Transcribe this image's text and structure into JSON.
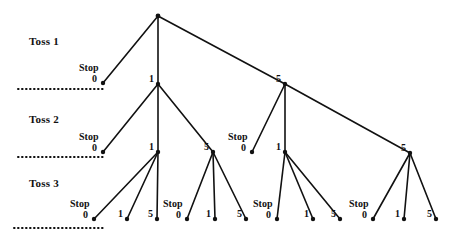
{
  "diagram": {
    "type": "tree",
    "line_color": "#111111",
    "node_color": "#111111",
    "background": "#ffffff",
    "dotted_color": "#111111"
  },
  "level_labels": [
    {
      "id": "toss1",
      "text": "Toss 1",
      "x": 29,
      "y": 35
    },
    {
      "id": "toss2",
      "text": "Toss 2",
      "x": 29,
      "y": 113
    },
    {
      "id": "toss3",
      "text": "Toss 3",
      "x": 29,
      "y": 177
    }
  ],
  "dotted_lines": [
    {
      "id": "divider-toss1",
      "x1": 18,
      "x2": 106,
      "y": 89
    },
    {
      "id": "divider-toss2",
      "x1": 18,
      "x2": 106,
      "y": 157
    },
    {
      "id": "divider-toss3",
      "x1": 14,
      "x2": 106,
      "y": 228
    }
  ],
  "nodes": [
    {
      "id": "root",
      "label": "",
      "stop": false,
      "x": 158,
      "y": 16,
      "level": 0
    },
    {
      "id": "t1-stop",
      "label": "0",
      "stop": true,
      "x": 103,
      "y": 83,
      "level": 1
    },
    {
      "id": "t1-one",
      "label": "1",
      "stop": false,
      "x": 158,
      "y": 84,
      "level": 1
    },
    {
      "id": "t1-five",
      "label": "5",
      "stop": false,
      "x": 285,
      "y": 84,
      "level": 1
    },
    {
      "id": "t2-a-stop",
      "label": "0",
      "stop": true,
      "x": 103,
      "y": 152,
      "level": 2
    },
    {
      "id": "t2-a-one",
      "label": "1",
      "stop": false,
      "x": 158,
      "y": 152,
      "level": 2
    },
    {
      "id": "t2-a-five",
      "label": "5",
      "stop": false,
      "x": 213,
      "y": 152,
      "level": 2
    },
    {
      "id": "t2-b-stop",
      "label": "0",
      "stop": true,
      "x": 252,
      "y": 152,
      "level": 2
    },
    {
      "id": "t2-b-one",
      "label": "1",
      "stop": false,
      "x": 285,
      "y": 152,
      "level": 2
    },
    {
      "id": "t2-b-five",
      "label": "5",
      "stop": false,
      "x": 410,
      "y": 153,
      "level": 2
    },
    {
      "id": "t3-a-stop",
      "label": "0",
      "stop": true,
      "x": 94,
      "y": 219,
      "level": 3
    },
    {
      "id": "t3-a-one",
      "label": "1",
      "stop": false,
      "x": 127,
      "y": 219,
      "level": 3
    },
    {
      "id": "t3-a-five",
      "label": "5",
      "stop": false,
      "x": 157,
      "y": 219,
      "level": 3
    },
    {
      "id": "t3-b-stop",
      "label": "0",
      "stop": true,
      "x": 187,
      "y": 219,
      "level": 3
    },
    {
      "id": "t3-b-one",
      "label": "1",
      "stop": false,
      "x": 215,
      "y": 219,
      "level": 3
    },
    {
      "id": "t3-b-five",
      "label": "5",
      "stop": false,
      "x": 246,
      "y": 219,
      "level": 3
    },
    {
      "id": "t3-c-stop",
      "label": "0",
      "stop": true,
      "x": 277,
      "y": 219,
      "level": 3
    },
    {
      "id": "t3-c-one",
      "label": "1",
      "stop": false,
      "x": 313,
      "y": 219,
      "level": 3
    },
    {
      "id": "t3-c-five",
      "label": "5",
      "stop": false,
      "x": 340,
      "y": 219,
      "level": 3
    },
    {
      "id": "t3-d-stop",
      "label": "0",
      "stop": true,
      "x": 373,
      "y": 219,
      "level": 3
    },
    {
      "id": "t3-d-one",
      "label": "1",
      "stop": false,
      "x": 404,
      "y": 219,
      "level": 3
    },
    {
      "id": "t3-d-five",
      "label": "5",
      "stop": false,
      "x": 436,
      "y": 219,
      "level": 3
    }
  ],
  "edges": [
    {
      "from": "root",
      "to": "t1-stop"
    },
    {
      "from": "root",
      "to": "t1-one"
    },
    {
      "from": "root",
      "to": "t1-five"
    },
    {
      "from": "t1-one",
      "to": "t2-a-stop"
    },
    {
      "from": "t1-one",
      "to": "t2-a-one"
    },
    {
      "from": "t1-one",
      "to": "t2-a-five"
    },
    {
      "from": "t1-five",
      "to": "t2-b-stop"
    },
    {
      "from": "t1-five",
      "to": "t2-b-one"
    },
    {
      "from": "t1-five",
      "to": "t2-b-five"
    },
    {
      "from": "t2-a-one",
      "to": "t3-a-stop"
    },
    {
      "from": "t2-a-one",
      "to": "t3-a-one"
    },
    {
      "from": "t2-a-one",
      "to": "t3-a-five"
    },
    {
      "from": "t2-a-five",
      "to": "t3-b-stop"
    },
    {
      "from": "t2-a-five",
      "to": "t3-b-one"
    },
    {
      "from": "t2-a-five",
      "to": "t3-b-five"
    },
    {
      "from": "t2-b-one",
      "to": "t3-c-stop"
    },
    {
      "from": "t2-b-one",
      "to": "t3-c-one"
    },
    {
      "from": "t2-b-one",
      "to": "t3-c-five"
    },
    {
      "from": "t2-b-five",
      "to": "t3-d-stop"
    },
    {
      "from": "t2-b-five",
      "to": "t3-d-one"
    },
    {
      "from": "t2-b-five",
      "to": "t3-d-five"
    }
  ],
  "stop_text": "Stop",
  "label_offsets": {
    "stop_word_dx": -24,
    "stop_word_dy": -21,
    "stop_num_dx": -11,
    "stop_num_dy": -10,
    "node_num_dx": -9,
    "node_num_dy": -11
  }
}
